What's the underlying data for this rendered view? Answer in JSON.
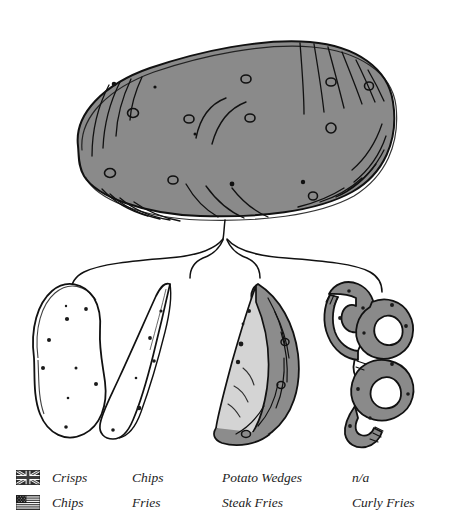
{
  "title": "Potato Cut Guide",
  "figure": {
    "source_label": "whole-potato",
    "branch_count": 4,
    "items": [
      {
        "id": "crisps",
        "shape": "oval-slice",
        "fill": "#ffffff",
        "outline": "#1a1a1a"
      },
      {
        "id": "chips",
        "shape": "thin-baton",
        "fill": "#ffffff",
        "outline": "#1a1a1a"
      },
      {
        "id": "wedges",
        "shape": "crescent",
        "fill": "#d2d2d2",
        "skin": "#8c8c8c",
        "outline": "#1a1a1a"
      },
      {
        "id": "curly",
        "shape": "spiral",
        "fill": "#8a8a8a",
        "outline": "#1a1a1a"
      }
    ],
    "potato_fill": "#8a8a8a",
    "line_color": "#111111"
  },
  "legend": {
    "rows": [
      {
        "flag": "uk-flag-icon",
        "flag_name": "United Kingdom",
        "cells": [
          "Crisps",
          "Chips",
          "Potato Wedges",
          "n/a"
        ]
      },
      {
        "flag": "us-flag-icon",
        "flag_name": "United States",
        "cells": [
          "Chips",
          "Fries",
          "Steak Fries",
          "Curly Fries"
        ]
      }
    ]
  }
}
